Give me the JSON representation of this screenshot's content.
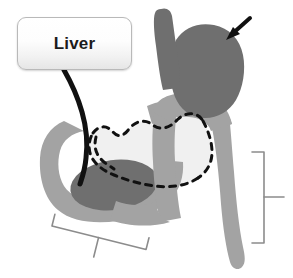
{
  "figure": {
    "background_color": "#ffffff"
  },
  "callout": {
    "label": "Liver",
    "border_color": "#b9b9b9",
    "text_color": "#1b1b1b",
    "leader_line_color": "#111111"
  },
  "palette": {
    "organ_dark": "#6f6f6f",
    "organ_medium": "#a3a3a3",
    "organ_light": "#f0f0f0",
    "outline_dashed": "#111111",
    "bracket": "#8c8c8c",
    "arrow": "#111111"
  },
  "structures": [
    {
      "name": "esophagus",
      "fill": "organ_dark"
    },
    {
      "name": "gastric-pouch",
      "fill": "organ_dark"
    },
    {
      "name": "roux-limb",
      "fill": "organ_medium"
    },
    {
      "name": "biliopancreatic-limb",
      "fill": "organ_medium"
    },
    {
      "name": "duodenum-loop",
      "fill": "organ_medium"
    },
    {
      "name": "pancreas-oval",
      "fill": "organ_dark"
    },
    {
      "name": "excluded-stomach-remnant",
      "fill": "organ_light",
      "outline": "dashed"
    },
    {
      "name": "liver-leader-line",
      "fill": "outline_dashed"
    }
  ],
  "annotations": {
    "pouch_arrow": {
      "name": "pointer-arrow",
      "target": "gastric-pouch",
      "direction": "down-left"
    },
    "right_bracket": {
      "name": "right-bracket",
      "orientation": "vertical",
      "tick": "right"
    },
    "bottom_bracket": {
      "name": "bottom-bracket",
      "orientation": "diagonal",
      "tick": "down-left"
    }
  }
}
